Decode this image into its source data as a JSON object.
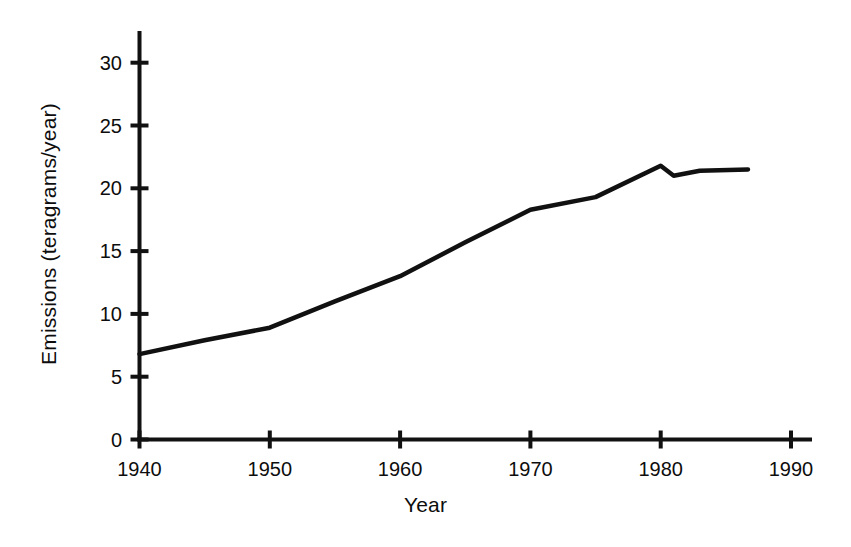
{
  "chart_data": {
    "type": "line",
    "title": "",
    "xlabel": "Year",
    "ylabel": "Emissions (teragrams/year)",
    "xlim": [
      1940,
      1990
    ],
    "ylim": [
      0,
      31
    ],
    "grid": false,
    "legend": "none",
    "line_color": "#111111",
    "background_color": "#ffffff",
    "xticks": [
      {
        "value": 1940,
        "label": "1940"
      },
      {
        "value": 1950,
        "label": "1950"
      },
      {
        "value": 1960,
        "label": "1960"
      },
      {
        "value": 1970,
        "label": "1970"
      },
      {
        "value": 1980,
        "label": "1980"
      },
      {
        "value": 1990,
        "label": "1990"
      }
    ],
    "yticks": [
      {
        "value": 0,
        "label": "0"
      },
      {
        "value": 5,
        "label": "5"
      },
      {
        "value": 10,
        "label": "10"
      },
      {
        "value": 15,
        "label": "15"
      },
      {
        "value": 20,
        "label": "20"
      },
      {
        "value": 25,
        "label": "25"
      },
      {
        "value": 30,
        "label": "30"
      }
    ],
    "series": [
      {
        "name": "Emissions",
        "x": [
          1940,
          1945,
          1950,
          1955,
          1960,
          1965,
          1970,
          1975,
          1980,
          1981,
          1983,
          1986.7
        ],
        "values": [
          6.8,
          7.9,
          8.9,
          11.0,
          13.0,
          15.7,
          18.3,
          19.3,
          21.8,
          21.0,
          21.4,
          21.5
        ]
      }
    ]
  }
}
